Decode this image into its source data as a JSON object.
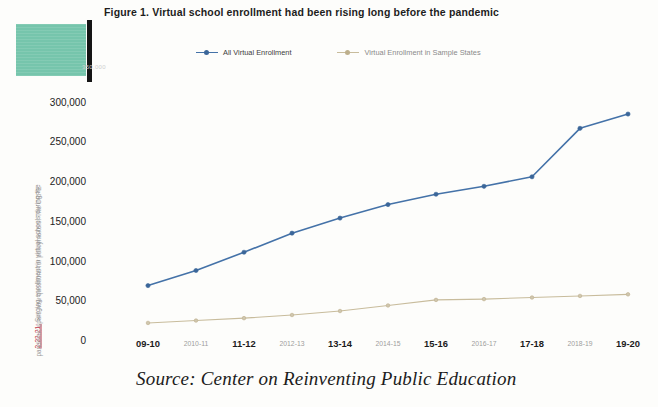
{
  "figure": {
    "title": "Figure 1. Virtual school enrollment had been rising long before the pandemic",
    "source": "Source: Center on Reinventing Public Education"
  },
  "annotations": {
    "side_note_line1": "2-22-21: Surging enrollment in virtual schools during the",
    "side_note_line2": "pandemic spurs new questions for policymakers. The CRPE",
    "side_note_date": "2-22-21:"
  },
  "colors": {
    "series_all": "#4472a8",
    "series_sample": "#c8bc9c",
    "teal_block": "#6fc3a8",
    "black_bar": "#151515",
    "axis_text": "#222222",
    "muted_text": "#9d9d9d",
    "date_red": "#c0394b"
  },
  "chart_data": {
    "type": "line",
    "title": "Figure 1. Virtual school enrollment had been rising long before the pandemic",
    "xlabel": "",
    "ylabel": "",
    "ylim": [
      0,
      350000
    ],
    "yticks": [
      0,
      50000,
      100000,
      150000,
      200000,
      250000,
      300000,
      350000
    ],
    "ytick_labels": [
      "0",
      "50,000",
      "100,000",
      "150,000",
      "200,000",
      "250,000",
      "300,000",
      "350,000"
    ],
    "ytick_top_faded": "350,000",
    "grid": false,
    "legend_position": "top",
    "categories": [
      "09-10",
      "2010-11",
      "11-12",
      "2012-13",
      "13-14",
      "2014-15",
      "15-16",
      "2016-17",
      "17-18",
      "2018-19",
      "19-20"
    ],
    "category_emphasis": [
      "major",
      "minor",
      "major",
      "minor",
      "major",
      "minor",
      "major",
      "minor",
      "major",
      "minor",
      "major"
    ],
    "series": [
      {
        "name": "All Virtual Enrollment",
        "color": "#4472a8",
        "values": [
          71000,
          90000,
          113000,
          137000,
          156000,
          173000,
          186000,
          196000,
          208000,
          269000,
          287000
        ]
      },
      {
        "name": "Virtual Enrollment in Sample States",
        "color": "#c8bc9c",
        "values": [
          24000,
          27000,
          30000,
          34000,
          39000,
          46000,
          53000,
          54000,
          56000,
          58000,
          60000
        ]
      }
    ]
  }
}
